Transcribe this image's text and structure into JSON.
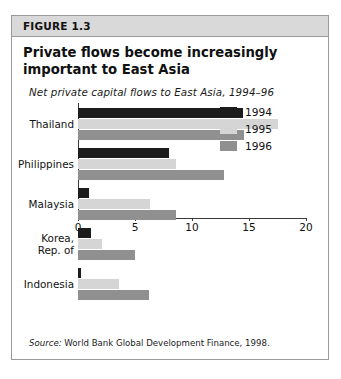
{
  "figure": {
    "header_label": "FIGURE 1.3",
    "title": "Private flows become increasingly important to East Asia",
    "subtitle": "Net private capital flows to East Asia, 1994–96",
    "source_label": "Source:",
    "source_text": " World Bank Global Development Finance, 1998."
  },
  "colors": {
    "series_1994": "#1c1c1c",
    "series_1995": "#d5d5d5",
    "series_1996": "#909090",
    "axis": "#3a3a3a",
    "header_bg": "#d9d9d9",
    "border": "#9a9a9a"
  },
  "chart_data": {
    "type": "bar",
    "orientation": "horizontal",
    "title": "Private flows become increasingly important to East Asia",
    "subtitle": "Net private capital flows to East Asia, 1994–96",
    "categories": [
      "Thailand",
      "Philippines",
      "Malaysia",
      "Korea, Rep. of",
      "Indonesia"
    ],
    "series": [
      {
        "name": "1994",
        "color": "#1c1c1c",
        "values": [
          14.5,
          8.0,
          1.0,
          1.1,
          0.3
        ]
      },
      {
        "name": "1995",
        "color": "#d5d5d5",
        "values": [
          17.5,
          8.6,
          6.3,
          2.1,
          3.6
        ]
      },
      {
        "name": "1996",
        "color": "#909090",
        "values": [
          14.6,
          12.8,
          8.6,
          5.0,
          6.2
        ]
      }
    ],
    "xlabel": "",
    "ylabel": "",
    "xlim": [
      0,
      20
    ],
    "xticks": [
      0,
      5,
      10,
      15,
      20
    ],
    "xtick_labels": [
      "0",
      "5",
      "10",
      "15",
      "20"
    ],
    "grid": false,
    "legend_position": "middle-right",
    "legend": [
      "1994",
      "1995",
      "1996"
    ]
  }
}
